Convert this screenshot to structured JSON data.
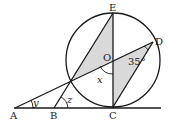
{
  "diagram": {
    "type": "geometry",
    "colors": {
      "stroke": "#1a1a1a",
      "shade": "#d9d9d9",
      "background": "#ffffff"
    },
    "circle": {
      "center_label": "O",
      "cx": 113,
      "cy": 60,
      "r": 47
    },
    "points": {
      "A": {
        "label": "A",
        "x": 15,
        "y": 108
      },
      "B": {
        "label": "B",
        "x": 54,
        "y": 108
      },
      "C": {
        "label": "C",
        "x": 113,
        "y": 107
      },
      "D": {
        "label": "D",
        "x": 153,
        "y": 42
      },
      "E": {
        "label": "E",
        "x": 113,
        "y": 13
      },
      "O": {
        "label": "O",
        "x": 113,
        "y": 60
      }
    },
    "angles": {
      "x": "x",
      "y": "y",
      "z": "z",
      "ODC": "35°"
    }
  }
}
